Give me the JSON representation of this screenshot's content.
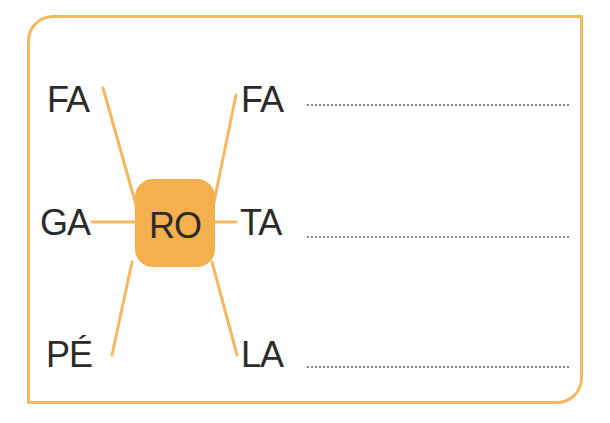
{
  "exercise": {
    "center_syllable": "RO",
    "left_syllables": [
      "FA",
      "GA",
      "PÉ"
    ],
    "right_syllables": [
      "FA",
      "TA",
      "LA"
    ],
    "answer_lines": [
      "",
      "",
      ""
    ],
    "colors": {
      "accent": "#f5b860",
      "center_fill": "#f5b04e",
      "text": "#2b2b2b"
    }
  }
}
